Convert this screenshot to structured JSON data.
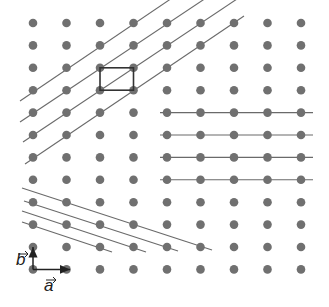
{
  "diagram": {
    "lattice": {
      "columns_x": [
        33,
        66.5,
        100,
        133.5,
        167,
        200.5,
        234,
        267.5,
        301
      ],
      "rows_y": [
        23,
        45.4,
        67.8,
        90.2,
        112.6,
        135,
        157.4,
        179.8,
        202.2,
        224.6,
        247,
        269.4
      ],
      "dot_radius": 4.3,
      "dot_color": "#707070"
    },
    "line_color": "#6a6a6a",
    "unit_cell": {
      "x1": 100,
      "y1": 67.8,
      "x2": 133.5,
      "y2": 90.2,
      "color": "#333333"
    },
    "line_families": [
      {
        "name": "diagonal-up",
        "lines": [
          [
            20,
            101,
            178,
            -6
          ],
          [
            20,
            122,
            212,
            -6
          ],
          [
            23,
            142,
            240,
            -3
          ],
          [
            25,
            164,
            244,
            16
          ]
        ]
      },
      {
        "name": "horizontal",
        "lines": [
          [
            160,
            112.6,
            313,
            112.6
          ],
          [
            160,
            135,
            313,
            135
          ],
          [
            160,
            157.4,
            313,
            157.4
          ],
          [
            160,
            179.8,
            313,
            179.8
          ]
        ]
      },
      {
        "name": "diagonal-down",
        "lines": [
          [
            22,
            188,
            212,
            250
          ],
          [
            24,
            201,
            178,
            251
          ],
          [
            22,
            211,
            146,
            252
          ],
          [
            22,
            222,
            112,
            252
          ]
        ]
      }
    ],
    "vectors": {
      "a": {
        "label": "a",
        "from": [
          33,
          269.4
        ],
        "to": [
          70,
          269.4
        ]
      },
      "b": {
        "label": "b",
        "from": [
          33,
          269.4
        ],
        "to": [
          33,
          247
        ]
      }
    }
  }
}
